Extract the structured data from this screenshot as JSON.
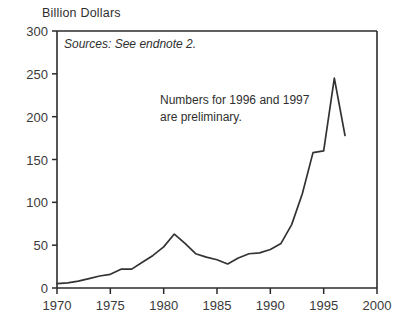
{
  "chart_data": {
    "type": "line",
    "title": "",
    "ylabel": "Billion Dollars",
    "xlabel": "",
    "xlim": [
      1970,
      2000
    ],
    "ylim": [
      0,
      300
    ],
    "grid": false,
    "legend": "none",
    "x": [
      1970,
      1971,
      1972,
      1973,
      1974,
      1975,
      1976,
      1977,
      1978,
      1979,
      1980,
      1981,
      1982,
      1983,
      1984,
      1985,
      1986,
      1987,
      1988,
      1989,
      1990,
      1991,
      1992,
      1993,
      1994,
      1995,
      1996,
      1997
    ],
    "series": [
      {
        "name": "Billion Dollars",
        "values": [
          5,
          6,
          8,
          11,
          14,
          16,
          22,
          22,
          30,
          38,
          48,
          63,
          52,
          40,
          36,
          33,
          28,
          35,
          40,
          41,
          45,
          52,
          74,
          110,
          158,
          160,
          245,
          178
        ]
      }
    ],
    "annotations": [
      {
        "id": "source-note",
        "text": "Sources: See endnote 2.",
        "style": "italic",
        "x": 1971.3,
        "y": 282
      },
      {
        "id": "preliminary-note",
        "lines": [
          "Numbers for 1996 and 1997",
          "are preliminary."
        ],
        "x": 1980.0,
        "y": 225
      }
    ],
    "yticks": [
      0,
      50,
      100,
      150,
      200,
      250,
      300
    ],
    "ytick_labels": [
      "0",
      "50",
      "100",
      "150",
      "200",
      "250",
      "300"
    ],
    "xticks": [
      1970,
      1975,
      1980,
      1985,
      1990,
      1995,
      2000
    ],
    "xtick_labels": [
      "1970",
      "1975",
      "1980",
      "1985",
      "1990",
      "1995",
      "2000"
    ],
    "line_color": "#333333",
    "axis_color": "#2b2b2b",
    "background_color": "#ffffff"
  },
  "axis_title": "Billion Dollars",
  "source_note": "Sources: See endnote 2.",
  "preliminary_note_line1": "Numbers for 1996 and 1997",
  "preliminary_note_line2": "are preliminary."
}
